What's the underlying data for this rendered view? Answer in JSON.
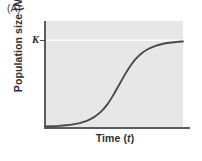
{
  "figure": {
    "panel_label": "(A)",
    "background_color": "#ffffff",
    "plot_background_color": "#e7e7e7",
    "axis_color": "#5c5c5c",
    "curve_color": "#4a4a4a",
    "capacity_line_color": "#ffffff"
  },
  "axes": {
    "ylabel_prefix": "Population size (",
    "ylabel_symbol": "N",
    "ylabel_suffix": ")",
    "xlabel_prefix": "Time (",
    "xlabel_symbol": "t",
    "xlabel_suffix": ")",
    "ytick_label": "K"
  },
  "chart_data": {
    "type": "line",
    "title": "(A)",
    "xlabel": "Time (t)",
    "ylabel": "Population size (N)",
    "grid": false,
    "legend": "none",
    "xlim": [
      0,
      1
    ],
    "ylim": [
      0,
      1.08
    ],
    "ytick_labels": [
      "K"
    ],
    "ytick_values": [
      1.0
    ],
    "xtick_labels": [],
    "annotations": [
      {
        "text": "K",
        "type": "carrying-capacity-line",
        "y": 1.0,
        "style": "solid white horizontal line across plot"
      }
    ],
    "series": [
      {
        "name": "logistic growth",
        "description": "sigmoid (logistic) population growth curve approaching carrying capacity K",
        "x": [
          0.0,
          0.05,
          0.1,
          0.15,
          0.2,
          0.25,
          0.3,
          0.35,
          0.4,
          0.45,
          0.5,
          0.55,
          0.6,
          0.65,
          0.7,
          0.75,
          0.8,
          0.85,
          0.9,
          0.95,
          1.0
        ],
        "y": [
          0.01,
          0.013,
          0.018,
          0.025,
          0.035,
          0.05,
          0.075,
          0.115,
          0.175,
          0.265,
          0.39,
          0.53,
          0.665,
          0.775,
          0.852,
          0.903,
          0.937,
          0.958,
          0.972,
          0.981,
          0.987
        ]
      }
    ]
  }
}
